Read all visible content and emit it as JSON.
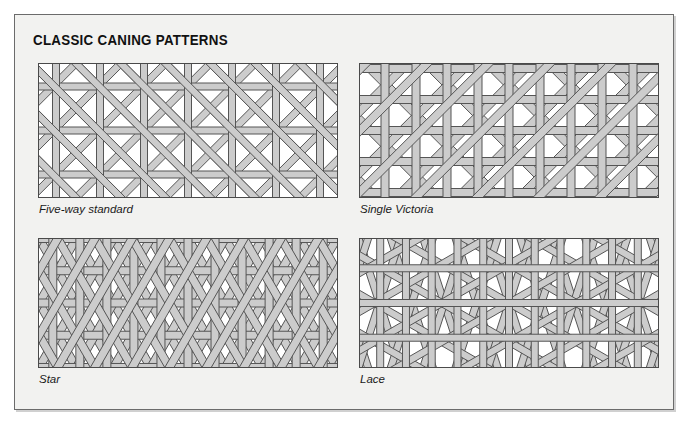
{
  "document": {
    "title": "CLASSIC CANING PATTERNS",
    "background_color": "#f2f2f0",
    "frame_color": "#6b6b6b",
    "strand_fill": "#cccccc",
    "strand_outline": "#555555",
    "panel_background": "#ffffff"
  },
  "patterns": [
    {
      "id": "five-way-standard",
      "label": "Five-way standard",
      "weave": "five-way",
      "description": "Horizontal, vertical and two diagonal strand sets woven over an open octagon grid.",
      "strand_sets": 5,
      "cell": 44,
      "strand_width": 7
    },
    {
      "id": "single-victoria",
      "label": "Single Victoria",
      "weave": "single-victoria",
      "description": "Open six-way weave with widely spaced verticals and single diagonals.",
      "strand_sets": 5,
      "cell": 62,
      "strand_width": 8
    },
    {
      "id": "star",
      "label": "Star",
      "weave": "star",
      "description": "Hexagonal star weave built from three 60-degree strand directions plus verticals.",
      "strand_sets": 4,
      "cell": 52,
      "strand_width": 8
    },
    {
      "id": "lace",
      "label": "Lace",
      "weave": "lace",
      "description": "Fine open lace weave with paired diagonals crossing a rectangular ground.",
      "strand_sets": 4,
      "cell": 56,
      "strand_width": 7
    }
  ]
}
